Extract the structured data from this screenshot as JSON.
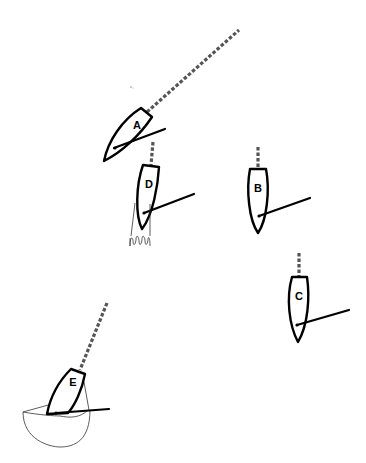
{
  "diagram": {
    "type": "sailing-boats-positions",
    "colors": {
      "hull_stroke": "#000000",
      "wake": "#555555",
      "background": "#ffffff"
    },
    "boats": [
      {
        "id": "A",
        "label": "A",
        "note": "heading up-right with long dashed wake line"
      },
      {
        "id": "B",
        "label": "B",
        "note": "upright, short dashed line above bow"
      },
      {
        "id": "C",
        "label": "C",
        "note": "upright, short dashed line above bow"
      },
      {
        "id": "D",
        "label": "D",
        "note": "slightly tilted, hand drawn below stern"
      },
      {
        "id": "E",
        "label": "E",
        "note": "tilted, inside a half-circle bowl"
      }
    ]
  }
}
